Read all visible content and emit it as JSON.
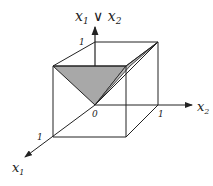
{
  "diagram": {
    "axes": {
      "vertical_label": "x1 ∨ x2",
      "vertical_label_main": "x",
      "vertical_label_sub1": "1",
      "vertical_op": " ∨ ",
      "vertical_label_main2": "x",
      "vertical_label_sub2": "2",
      "x2_main": "x",
      "x2_sub": "2",
      "x1_main": "x",
      "x1_sub": "1"
    },
    "ticks": {
      "origin": "0",
      "vertical_one": "1",
      "x2_one": "1",
      "x1_one": "1"
    },
    "colors": {
      "line": "#222222",
      "shade": "#a8a8a8"
    }
  }
}
